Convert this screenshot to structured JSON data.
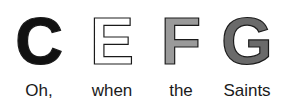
{
  "items": [
    {
      "letter": "C",
      "word": "Oh,",
      "fill": "#111111"
    },
    {
      "letter": "E",
      "word": "when",
      "fill": "#ffffff"
    },
    {
      "letter": "F",
      "word": "the",
      "fill": "#9a9a9a"
    },
    {
      "letter": "G",
      "word": "Saints",
      "fill": "#6a6a6a"
    }
  ]
}
